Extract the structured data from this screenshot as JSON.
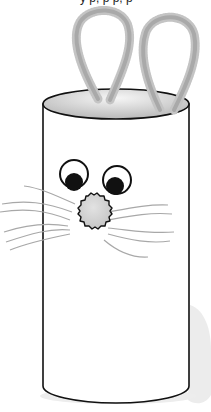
{
  "scene": {
    "subject": "Toilet paper roll bunny craft",
    "caption_fragment": "y p, p p, p",
    "parts": {
      "ears": "pipe-cleaner loops",
      "eyes": "googly eyes",
      "nose": "pom-pom",
      "whiskers": "pipe-cleaner whiskers"
    },
    "colors": {
      "outline": "#111111",
      "tube_fill": "#ffffff",
      "ear_fill": "#b8b8b8",
      "nose_fill": "#d2d2d2",
      "whisker": "#a8a8a8",
      "shadow": "#ececec"
    }
  }
}
